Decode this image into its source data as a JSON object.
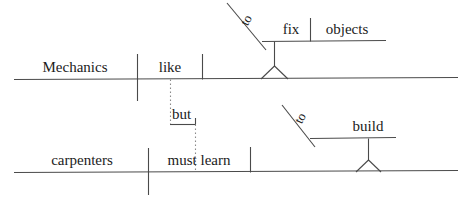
{
  "diagram": {
    "sentence": "Mechanics like to fix objects, but carpenters must learn to build.",
    "ink_color": "#4a4a4a",
    "text_color": "#1b1b1b",
    "clauses": [
      {
        "id": "clause-1",
        "subject": "Mechanics",
        "verb": "like",
        "object_phrase": {
          "type": "infinitive",
          "preposition": "to",
          "verb": "fix",
          "object": "objects"
        }
      },
      {
        "id": "clause-2",
        "subject": "carpenters",
        "verb": "must learn",
        "object_phrase": {
          "type": "infinitive",
          "preposition": "to",
          "verb": "build",
          "object": ""
        }
      }
    ],
    "conjunction": {
      "label": "but",
      "line_style": "dotted"
    },
    "labels": {
      "subject_1": "Mechanics",
      "verb_1": "like",
      "inf_to_1": "to",
      "inf_verb_1": "fix",
      "inf_object_1": "objects",
      "conjunction": "but",
      "subject_2": "carpenters",
      "verb_2": "must learn",
      "inf_to_2": "to",
      "inf_verb_2": "build"
    }
  }
}
